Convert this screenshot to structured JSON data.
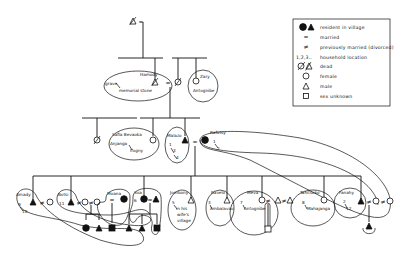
{
  "diagram": {
    "type": "kinship-chart",
    "legend": {
      "items": [
        {
          "symbol": "filled-circle-triangle",
          "label": "resident in village"
        },
        {
          "symbol": "=",
          "label": "married"
        },
        {
          "symbol": "≠",
          "label": "previously married (divorced)"
        },
        {
          "symbol": "1,2,3..",
          "label": "household location"
        },
        {
          "symbol": "slashed-circle-triangle",
          "label": "dead"
        },
        {
          "symbol": "open-circle",
          "label": "female"
        },
        {
          "symbol": "open-triangle",
          "label": "male"
        },
        {
          "symbol": "open-square",
          "label": "sex unknown"
        }
      ]
    },
    "generation1": {
      "marriage_sign": "="
    },
    "generation2": {
      "hamody": {
        "name": "Hamody",
        "note1": "grave",
        "note2": "memorial stone"
      },
      "marriage_sign": "=",
      "zary": {
        "name": "Zary",
        "place": "Antognibe"
      }
    },
    "generation3": {
      "safia": {
        "name": "Safia Bevaoka",
        "place": "Anjanga",
        "place2": "Ifogny"
      },
      "malazo": {
        "name": "Malazo",
        "households": [
          "1",
          "3",
          "4"
        ]
      },
      "marriage_sign": "=",
      "rafotsy": {
        "name": "Rafotsy",
        "households": [
          "1",
          "2"
        ]
      }
    },
    "generation4": {
      "amady": {
        "name": "Amady",
        "households": [
          "9",
          "10"
        ],
        "divorce_sign": "≠"
      },
      "botsi": {
        "name": "Botsi",
        "household": "11",
        "divorce_sign": "≠"
      },
      "moana": {
        "name": "Moana",
        "marriage_sign": "="
      },
      "soa": {
        "name": "Soa",
        "household": "6",
        "marriage_sign": "="
      },
      "jombony": {
        "name": "Jombony",
        "household": "5",
        "place_lines": [
          "in his",
          "wife's",
          "village"
        ]
      },
      "ravelo": {
        "name": "Ravelo",
        "household": "3",
        "place": "Ambalavao"
      },
      "meva": {
        "name": "Meva",
        "household": "7",
        "place": "Antognibe",
        "divorce_sign": "≠"
      },
      "tahitsoko": {
        "name": "Tahitsoko",
        "household": "8",
        "place": "Mahajanga"
      },
      "fanahy": {
        "name": "Fanahy",
        "households": [
          "2",
          "12"
        ],
        "divorce_sign": "≠"
      }
    }
  }
}
